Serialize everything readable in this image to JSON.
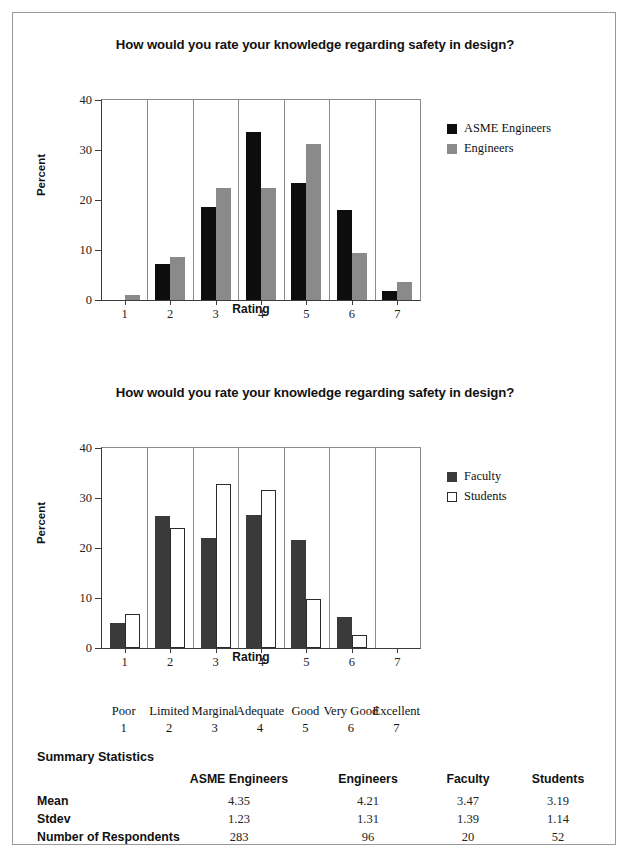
{
  "document": {
    "border_color": "#9a9a9a",
    "background": "#ffffff"
  },
  "chart_data": [
    {
      "id": "chart1",
      "type": "bar",
      "title": "How would you rate your knowledge regarding safety in design?",
      "xlabel": "Rating",
      "ylabel": "Percent",
      "categories": [
        "1",
        "2",
        "3",
        "4",
        "5",
        "6",
        "7"
      ],
      "ylim": [
        0,
        40
      ],
      "yticks": [
        0,
        10,
        20,
        30,
        40
      ],
      "grid": "vertical",
      "legend_position": "right",
      "series": [
        {
          "name": "ASME Engineers",
          "color": "#0d0d0d",
          "border": "#0d0d0d",
          "values": [
            0,
            7.2,
            18.7,
            33.6,
            23.4,
            18.1,
            1.8
          ]
        },
        {
          "name": "Engineers",
          "color": "#8a8a8a",
          "border": "#8a8a8a",
          "values": [
            1.0,
            8.7,
            22.5,
            22.4,
            31.3,
            9.4,
            3.6
          ]
        }
      ]
    },
    {
      "id": "chart2",
      "type": "bar",
      "title": "How would you rate your knowledge regarding safety in design?",
      "xlabel": "Rating",
      "ylabel": "Percent",
      "categories": [
        "1",
        "2",
        "3",
        "4",
        "5",
        "6",
        "7"
      ],
      "ylim": [
        0,
        40
      ],
      "yticks": [
        0,
        10,
        20,
        30,
        40
      ],
      "grid": "vertical",
      "legend_position": "right",
      "series": [
        {
          "name": "Faculty",
          "color": "#3a3a3a",
          "border": "#3a3a3a",
          "values": [
            5.0,
            26.4,
            22.1,
            26.6,
            21.6,
            6.2,
            0
          ]
        },
        {
          "name": "Students",
          "color": "#ffffff",
          "border": "#2b2b2b",
          "values": [
            6.9,
            24.0,
            32.8,
            31.7,
            9.9,
            2.7,
            0
          ]
        }
      ]
    }
  ],
  "scale": {
    "items": [
      {
        "label": "Poor",
        "number": "1"
      },
      {
        "label": "Limited",
        "number": "2"
      },
      {
        "label": "Marginal",
        "number": "3"
      },
      {
        "label": "Adequate",
        "number": "4"
      },
      {
        "label": "Good",
        "number": "5"
      },
      {
        "label": "Very Good",
        "number": "6"
      },
      {
        "label": "Excellent",
        "number": "7"
      }
    ]
  },
  "summary": {
    "title": "Summary Statistics",
    "columns": [
      "ASME Engineers",
      "Engineers",
      "Faculty",
      "Students"
    ],
    "rows": [
      {
        "label": "Mean",
        "values": [
          "4.35",
          "4.21",
          "3.47",
          "3.19"
        ]
      },
      {
        "label": "Stdev",
        "values": [
          "1.23",
          "1.31",
          "1.39",
          "1.14"
        ]
      },
      {
        "label": "Number of Respondents",
        "values": [
          "283",
          "96",
          "20",
          "52"
        ]
      }
    ]
  }
}
